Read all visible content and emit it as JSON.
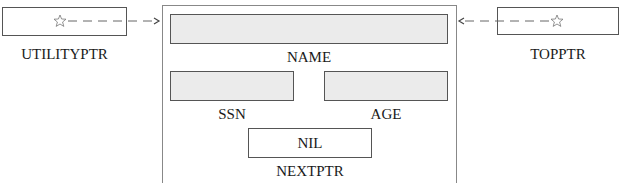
{
  "diagram": {
    "utility_pointer": {
      "label": "UTILITYPTR",
      "marker": "star-icon"
    },
    "top_pointer": {
      "label": "TOPPTR",
      "marker": "star-icon"
    },
    "record": {
      "fields": {
        "name": {
          "label": "NAME",
          "value": ""
        },
        "ssn": {
          "label": "SSN",
          "value": ""
        },
        "age": {
          "label": "AGE",
          "value": ""
        },
        "nextptr": {
          "label": "NEXTPTR",
          "value": "NIL"
        }
      }
    },
    "colors": {
      "field_fill": "#ebebeb",
      "border": "#555555",
      "arrow": "#666666"
    }
  }
}
